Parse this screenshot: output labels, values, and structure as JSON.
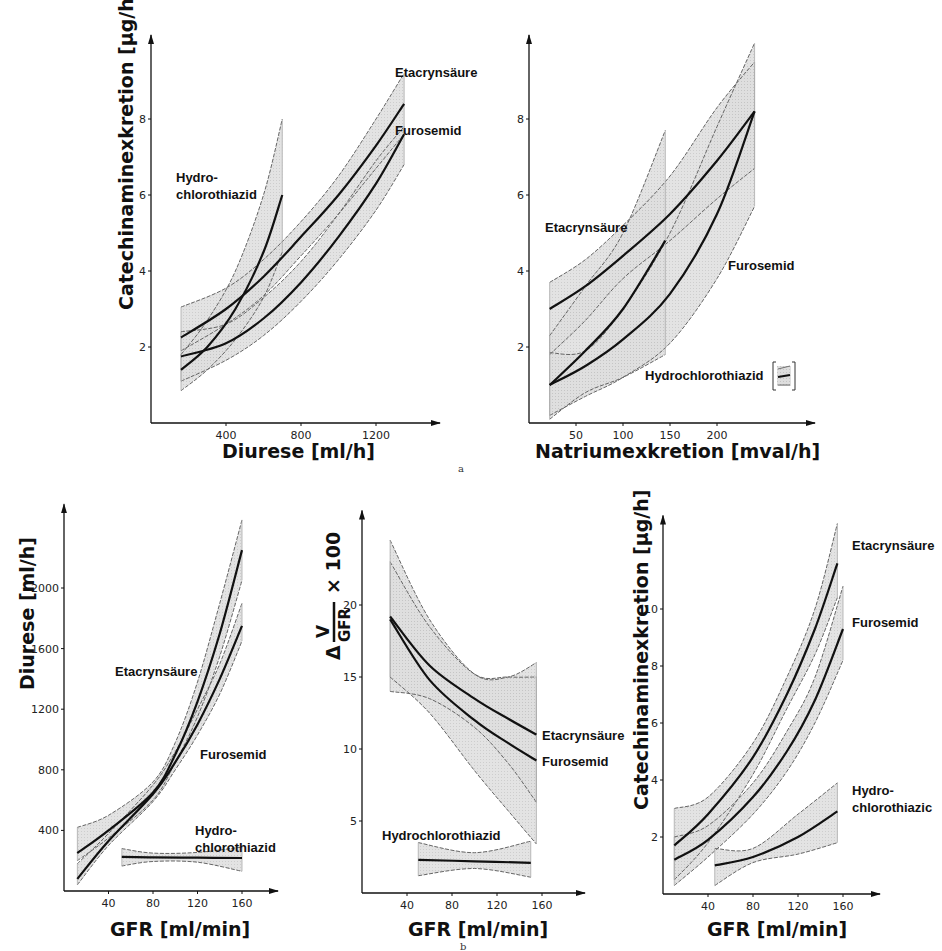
{
  "figure": {
    "panel_labels": [
      "a",
      "b"
    ]
  },
  "chart_data": [
    {
      "id": "a-left",
      "panel": "a",
      "type": "line",
      "title": "",
      "xlabel": "Diurese [ml/h]",
      "ylabel": "Catechinaminexkretion [µg/h]",
      "xticks": [
        400,
        800,
        1200
      ],
      "yticks": [
        2,
        4,
        6,
        8
      ],
      "xlim": [
        0,
        1500
      ],
      "ylim": [
        0,
        10
      ],
      "grid": false,
      "frame": {
        "ox": 151,
        "oy": 423,
        "xscale": 0.1875,
        "yscale": 38.0,
        "xend": 440,
        "yend": 10
      },
      "series": [
        {
          "name": "Etacrynsäure",
          "x": [
            160,
            400,
            600,
            800,
            1000,
            1200,
            1350
          ],
          "y": [
            2.25,
            3.0,
            3.85,
            4.9,
            6.0,
            7.3,
            8.4
          ],
          "lower": [
            1.9,
            2.6,
            3.35,
            4.4,
            5.5,
            6.7,
            7.6
          ],
          "upper": [
            3.05,
            3.55,
            4.3,
            5.3,
            6.5,
            8.0,
            9.2
          ],
          "label_xy": [
            395,
            77
          ]
        },
        {
          "name": "Furosemid",
          "x": [
            160,
            400,
            600,
            800,
            1000,
            1200,
            1350
          ],
          "y": [
            1.75,
            2.1,
            2.75,
            3.7,
            4.9,
            6.3,
            7.6
          ],
          "lower": [
            1.1,
            1.65,
            2.3,
            3.2,
            4.3,
            5.6,
            6.8
          ],
          "upper": [
            2.4,
            2.6,
            3.3,
            4.25,
            5.5,
            6.9,
            7.8
          ],
          "label_xy": [
            395,
            135
          ]
        },
        {
          "name": "Hydrochlorothiazid",
          "x": [
            160,
            300,
            450,
            600,
            700
          ],
          "y": [
            1.4,
            2.0,
            3.0,
            4.5,
            6.0
          ],
          "lower": [
            0.85,
            1.4,
            2.2,
            3.3,
            4.5
          ],
          "upper": [
            1.8,
            2.7,
            4.0,
            6.0,
            8.0
          ],
          "label_lines": [
            "Hydro-",
            "chlorothiazid"
          ],
          "label_xy": [
            176,
            182
          ]
        }
      ]
    },
    {
      "id": "a-right",
      "panel": "a",
      "type": "line",
      "title": "",
      "xlabel": "Natriumexkretion [mval/h]",
      "ylabel": "",
      "xticks": [
        50,
        100,
        150,
        200
      ],
      "yticks": [
        2,
        4,
        6,
        8
      ],
      "xlim": [
        0,
        290
      ],
      "ylim": [
        0,
        10
      ],
      "grid": false,
      "frame": {
        "ox": 529,
        "oy": 423,
        "xscale": 0.94,
        "yscale": 38.0,
        "xend": 815,
        "yend": 10
      },
      "series": [
        {
          "name": "Etacrynsäure",
          "x": [
            22,
            60,
            100,
            150,
            200,
            240
          ],
          "y": [
            3.0,
            3.6,
            4.4,
            5.5,
            6.9,
            8.2
          ],
          "lower": [
            1.8,
            2.7,
            3.8,
            4.8,
            5.9,
            6.7
          ],
          "upper": [
            3.7,
            4.3,
            5.2,
            6.5,
            8.3,
            9.5
          ],
          "label_xy": [
            545,
            232
          ]
        },
        {
          "name": "Furosemid",
          "x": [
            22,
            60,
            100,
            150,
            200,
            240
          ],
          "y": [
            1.0,
            1.5,
            2.2,
            3.4,
            5.5,
            8.2
          ],
          "lower": [
            0.2,
            0.7,
            1.2,
            2.1,
            3.8,
            5.7
          ],
          "upper": [
            1.85,
            1.9,
            3.0,
            5.0,
            7.8,
            10.0
          ],
          "label_xy": [
            728,
            270
          ]
        },
        {
          "name": "Hydrochlorothiazid",
          "x": [
            22,
            60,
            100,
            145
          ],
          "y": [
            1.0,
            1.9,
            3.0,
            4.8
          ],
          "lower": [
            0.1,
            0.8,
            1.2,
            1.8
          ],
          "upper": [
            2.3,
            3.6,
            5.0,
            7.7
          ],
          "label_xy": [
            645,
            380
          ],
          "legend_bracket": true
        }
      ]
    },
    {
      "id": "b-left",
      "panel": "b",
      "type": "line",
      "title": "",
      "xlabel": "GFR [ml/min]",
      "ylabel": "Diurese [ml/h]",
      "xticks": [
        40,
        80,
        120,
        160
      ],
      "yticks": [
        400,
        800,
        1200,
        1600,
        2000
      ],
      "xlim": [
        0,
        190
      ],
      "ylim": [
        0,
        2500
      ],
      "grid": false,
      "frame": {
        "ox": 64,
        "oy": 891,
        "xscale": 1.1125,
        "yscale": 0.1515,
        "xend": 278,
        "yend": 2500
      },
      "series": [
        {
          "name": "Etacrynsäure",
          "x": [
            12,
            40,
            80,
            100,
            120,
            140,
            160
          ],
          "y": [
            250,
            400,
            650,
            900,
            1250,
            1700,
            2250
          ],
          "lower": [
            200,
            350,
            600,
            850,
            1150,
            1550,
            2050
          ],
          "upper": [
            420,
            500,
            720,
            980,
            1380,
            1900,
            2450
          ],
          "label_xy": [
            115,
            676
          ]
        },
        {
          "name": "Furosemid",
          "x": [
            12,
            40,
            80,
            100,
            120,
            140,
            160
          ],
          "y": [
            80,
            330,
            640,
            850,
            1100,
            1400,
            1750
          ],
          "lower": [
            40,
            300,
            590,
            800,
            1030,
            1300,
            1650
          ],
          "upper": [
            180,
            380,
            700,
            920,
            1200,
            1500,
            1900
          ],
          "label_xy": [
            200,
            759
          ]
        },
        {
          "name": "Hydrochlorothiazid",
          "x": [
            52,
            80,
            120,
            160
          ],
          "y": [
            225,
            222,
            220,
            218
          ],
          "lower": [
            165,
            195,
            190,
            130
          ],
          "upper": [
            280,
            250,
            255,
            290
          ],
          "label_lines": [
            "Hydro-",
            "chlorothiazid"
          ],
          "label_xy": [
            195,
            835
          ]
        }
      ]
    },
    {
      "id": "b-middle",
      "panel": "b",
      "type": "line",
      "title": "",
      "xlabel": "GFR [ml/min]",
      "ylabel": "Δ V/GFR × 100",
      "xticks": [
        40,
        80,
        120,
        160
      ],
      "yticks": [
        5,
        10,
        15,
        20
      ],
      "xlim": [
        0,
        190
      ],
      "ylim": [
        0,
        25
      ],
      "grid": false,
      "frame": {
        "ox": 362,
        "oy": 893,
        "xscale": 1.125,
        "yscale": 14.4,
        "xend": 585,
        "yend": 26
      },
      "series": [
        {
          "name": "Etacrynsäure",
          "x": [
            25,
            60,
            100,
            130,
            155
          ],
          "y": [
            19.2,
            15.8,
            13.5,
            12.1,
            11.0
          ],
          "lower": [
            14.0,
            13.5,
            11.5,
            9.0,
            6.3
          ],
          "upper": [
            23.0,
            18.5,
            15.2,
            15.0,
            15.0
          ],
          "label_xy": [
            542,
            740
          ]
        },
        {
          "name": "Furosemid",
          "x": [
            25,
            60,
            100,
            130,
            155
          ],
          "y": [
            19.0,
            14.8,
            12.0,
            10.4,
            9.2
          ],
          "lower": [
            15.0,
            12.5,
            8.5,
            5.7,
            3.4
          ],
          "upper": [
            24.5,
            19.0,
            15.2,
            15.0,
            16.0
          ],
          "label_xy": [
            542,
            766
          ]
        },
        {
          "name": "Hydrochlorothiazid",
          "x": [
            50,
            100,
            150
          ],
          "y": [
            2.3,
            2.2,
            2.1
          ],
          "lower": [
            1.2,
            1.7,
            1.1
          ],
          "upper": [
            3.5,
            2.8,
            3.6
          ],
          "label_xy": [
            382,
            840
          ]
        }
      ]
    },
    {
      "id": "b-right",
      "panel": "b",
      "type": "line",
      "title": "",
      "xlabel": "GFR [ml/min]",
      "ylabel": "Catechinaminexkretion [µg/h]",
      "xticks": [
        40,
        80,
        120,
        160
      ],
      "yticks": [
        2,
        4,
        6,
        8,
        10
      ],
      "xlim": [
        0,
        190
      ],
      "ylim": [
        0,
        13
      ],
      "grid": false,
      "frame": {
        "ox": 663,
        "oy": 894,
        "xscale": 1.125,
        "yscale": 28.5,
        "xend": 880,
        "yend": 13
      },
      "series": [
        {
          "name": "Etacrynsäure",
          "x": [
            10,
            40,
            80,
            110,
            135,
            155
          ],
          "y": [
            1.7,
            2.8,
            4.8,
            7.0,
            9.3,
            11.6
          ],
          "lower": [
            0.5,
            1.8,
            4.2,
            6.5,
            8.4,
            10.4
          ],
          "upper": [
            3.0,
            3.4,
            5.3,
            7.6,
            10.0,
            13.0
          ],
          "label_xy": [
            852,
            550
          ]
        },
        {
          "name": "Furosemid",
          "x": [
            10,
            40,
            80,
            110,
            135,
            160
          ],
          "y": [
            1.2,
            1.9,
            3.4,
            5.0,
            6.8,
            9.3
          ],
          "lower": [
            0.3,
            1.3,
            2.8,
            4.3,
            6.0,
            8.2
          ],
          "upper": [
            2.0,
            2.4,
            3.9,
            5.7,
            7.6,
            10.8
          ],
          "label_xy": [
            852,
            627
          ]
        },
        {
          "name": "Hydrochlorothiazid",
          "x": [
            46,
            80,
            120,
            155
          ],
          "y": [
            1.0,
            1.3,
            2.0,
            2.9
          ],
          "lower": [
            0.3,
            1.1,
            1.4,
            1.8
          ],
          "upper": [
            1.6,
            1.6,
            2.8,
            3.9
          ],
          "label_lines": [
            "Hydro-",
            "chlorothiazic"
          ],
          "label_xy": [
            852,
            795
          ]
        }
      ]
    }
  ]
}
